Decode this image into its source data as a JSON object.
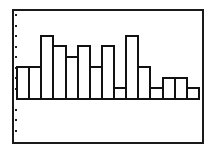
{
  "chart_data": {
    "type": "bar",
    "subtype": "histogram",
    "title": "",
    "xlabel": "",
    "ylabel": "",
    "categories": [
      "1",
      "2",
      "3",
      "4",
      "5",
      "6",
      "7",
      "8",
      "9",
      "10",
      "11",
      "12",
      "13",
      "14",
      "15"
    ],
    "values": [
      3,
      3,
      6,
      5,
      4,
      5,
      3,
      5,
      1,
      6,
      3,
      1,
      2,
      2,
      1
    ],
    "ylim": [
      -3,
      8
    ],
    "y_tick_step": 1,
    "grid": false,
    "legend": null,
    "style": {
      "bar_fill": "#ffffff",
      "bar_outline": "#111111",
      "frame": "#1a1a1a",
      "tick_marks": "dots on left edge"
    }
  },
  "layout": {
    "frame": {
      "left": 12,
      "top": 9,
      "right": 204,
      "bottom": 143
    },
    "plot_x_start": 16,
    "plot_x_end": 198,
    "baseline_y": 99,
    "unit_px": 10.5,
    "tick_x": 16
  }
}
